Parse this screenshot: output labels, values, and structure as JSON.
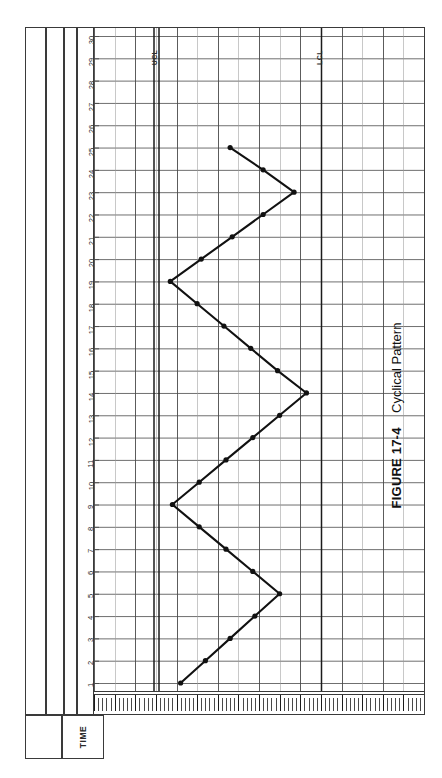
{
  "document": {
    "caption_label": "FIGURE 17-4",
    "caption_title": "Cyclical Pattern",
    "axis_row_label": "TIME"
  },
  "limits": {
    "ucl_label": "UCL",
    "lcl_label": "LCL"
  },
  "colors": {
    "ink": "#1b1b1b",
    "rule": "#3a3a3a",
    "grid_major": "#4a4a4a",
    "grid_minor": "#9a9a9a",
    "paper": "#ffffff",
    "series": "#111111"
  },
  "chart_data": {
    "type": "line",
    "title": "Cyclical Pattern",
    "subtitle": "FIGURE 17-4",
    "xlabel": "TIME",
    "ylabel": "",
    "orientation": "rotated-90",
    "grid": true,
    "legend": "none",
    "xlim": [
      1,
      30
    ],
    "ylim": [
      0,
      16
    ],
    "ytick_interval": 1,
    "control_limits": {
      "UCL": 3.0,
      "LCL": 11.0
    },
    "xtick_labels": [
      "1",
      "2",
      "3",
      "4",
      "5",
      "6",
      "7",
      "8",
      "9",
      "10",
      "11",
      "12",
      "13",
      "14",
      "15",
      "16",
      "17",
      "18",
      "19",
      "20",
      "21",
      "22",
      "23",
      "24",
      "25",
      "26",
      "27",
      "28",
      "29",
      "30"
    ],
    "x": [
      1,
      2,
      3,
      4,
      5,
      6,
      7,
      8,
      9,
      10,
      11,
      12,
      13,
      14,
      15,
      16,
      17,
      18,
      19,
      20,
      21,
      22,
      23,
      24,
      25
    ],
    "values": [
      4.2,
      5.4,
      6.6,
      7.8,
      9.0,
      7.7,
      6.4,
      5.1,
      3.8,
      5.1,
      6.4,
      7.7,
      9.0,
      10.3,
      8.9,
      7.6,
      6.3,
      5.0,
      3.7,
      5.2,
      6.7,
      8.2,
      9.7,
      8.2,
      6.6
    ],
    "series": [
      {
        "name": "Sample value",
        "marker": "filled-circle",
        "values": [
          4.2,
          5.4,
          6.6,
          7.8,
          9.0,
          7.7,
          6.4,
          5.1,
          3.8,
          5.1,
          6.4,
          7.7,
          9.0,
          10.3,
          8.9,
          7.6,
          6.3,
          5.0,
          3.7,
          5.2,
          6.7,
          8.2,
          9.7,
          8.2,
          6.6
        ]
      }
    ],
    "annotations": [
      "UCL",
      "LCL"
    ]
  }
}
